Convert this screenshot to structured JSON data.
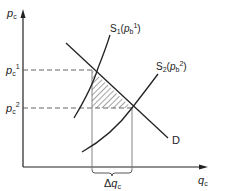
{
  "diagram": {
    "type": "supply-demand",
    "axes": {
      "y_label": {
        "base": "p",
        "sub": "c"
      },
      "x_label": {
        "base": "q",
        "sub": "c"
      }
    },
    "price_levels": [
      {
        "base": "p",
        "sub": "c",
        "sup": "1"
      },
      {
        "base": "p",
        "sub": "c",
        "sup": "2"
      }
    ],
    "curves": {
      "s1": {
        "base": "S",
        "sub": "1",
        "arg_base": "p",
        "arg_sub": "b",
        "arg_sup": "1"
      },
      "s2": {
        "base": "S",
        "sub": "2",
        "arg_base": "p",
        "arg_sub": "b",
        "arg_sup": "2"
      },
      "demand": {
        "label": "D"
      }
    },
    "delta": {
      "symbol": "Δ",
      "base": "q",
      "sub": "c"
    },
    "colors": {
      "line": "#222222",
      "dash": "#555555",
      "hatch": "#333333",
      "background": "#ffffff"
    }
  }
}
